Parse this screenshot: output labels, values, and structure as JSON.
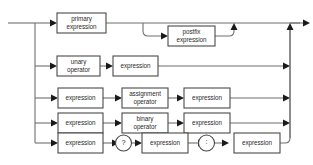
{
  "diagram": {
    "title": "expression",
    "type": "railroad-syntax-diagram",
    "colors": {
      "line": "#6f6f6f",
      "box_border": "#4a4a4a",
      "box_fill": "#ffffff",
      "arrow": "#1a1a1a",
      "text": "#2b2b2b",
      "background": "#ffffff"
    },
    "alternatives": [
      {
        "id": "primary",
        "nodes": [
          "primary expression"
        ],
        "loop": {
          "label": "postfix expression"
        }
      },
      {
        "id": "unary",
        "nodes": [
          "unary operator",
          "expression"
        ]
      },
      {
        "id": "assignment",
        "nodes": [
          "expression",
          "assignment operator",
          "expression"
        ]
      },
      {
        "id": "binary",
        "nodes": [
          "expression",
          "binary operator",
          "expression"
        ]
      },
      {
        "id": "ternary",
        "nodes": [
          "expression",
          "?",
          "expression",
          ":",
          "expression"
        ]
      }
    ]
  },
  "labels": {
    "primary_expression_l1": "primary",
    "primary_expression_l2": "expression",
    "postfix_expression_l1": "postfix",
    "postfix_expression_l2": "expression",
    "unary_operator_l1": "unary",
    "unary_operator_l2": "operator",
    "unary_expression": "expression",
    "assign_expr_left": "expression",
    "assignment_operator_l1": "assignment",
    "assignment_operator_l2": "operator",
    "assign_expr_right": "expression",
    "binary_expr_left": "expression",
    "binary_operator_l1": "binary",
    "binary_operator_l2": "operator",
    "binary_expr_right": "expression",
    "ternary_expr_cond": "expression",
    "ternary_question": "?",
    "ternary_expr_then": "expression",
    "ternary_colon": ":",
    "ternary_expr_else": "expression"
  }
}
